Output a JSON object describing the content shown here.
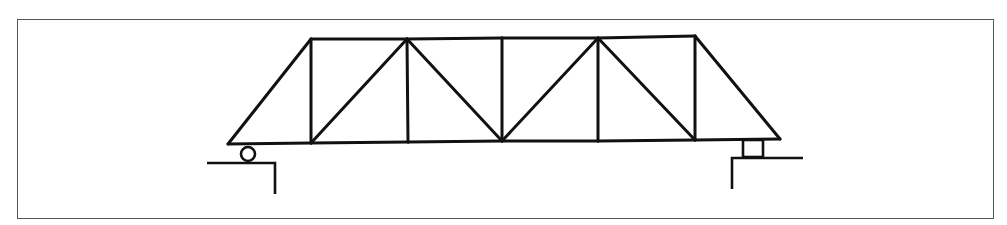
{
  "figure": {
    "frame": {
      "x": 17,
      "y": 19,
      "width": 977,
      "height": 200,
      "color": "#555555"
    },
    "stroke_color": "#111111"
  },
  "truss": {
    "type": "truss",
    "nodes": {
      "B0": [
        228,
        144
      ],
      "B1": [
        311,
        143
      ],
      "B2": [
        408,
        142
      ],
      "B3": [
        502,
        141
      ],
      "B4": [
        598,
        141
      ],
      "B5": [
        695,
        140
      ],
      "B6": [
        780,
        139
      ],
      "T1": [
        311,
        39
      ],
      "T2": [
        407,
        39
      ],
      "T3": [
        502,
        38
      ],
      "T4": [
        598,
        38
      ],
      "T5": [
        695,
        36
      ]
    },
    "members": [
      [
        "B0",
        "B1"
      ],
      [
        "B1",
        "B2"
      ],
      [
        "B2",
        "B3"
      ],
      [
        "B3",
        "B4"
      ],
      [
        "B4",
        "B5"
      ],
      [
        "B5",
        "B6"
      ],
      [
        "T1",
        "T2"
      ],
      [
        "T2",
        "T3"
      ],
      [
        "T3",
        "T4"
      ],
      [
        "T4",
        "T5"
      ],
      [
        "B0",
        "T1"
      ],
      [
        "T5",
        "B6"
      ],
      [
        "B1",
        "T1"
      ],
      [
        "B2",
        "T2"
      ],
      [
        "B3",
        "T3"
      ],
      [
        "B4",
        "T4"
      ],
      [
        "B5",
        "T5"
      ],
      [
        "B1",
        "T2"
      ],
      [
        "T2",
        "B3"
      ],
      [
        "B3",
        "T4"
      ],
      [
        "T4",
        "B5"
      ]
    ]
  },
  "supports": {
    "left": {
      "type": "roller",
      "circle": {
        "cx": 248,
        "cy": 154,
        "r": 7
      },
      "ground": [
        [
          207,
          163
        ],
        [
          275,
          163
        ],
        [
          275,
          194
        ]
      ]
    },
    "right": {
      "type": "pin-block",
      "block": {
        "x": 743,
        "y": 140,
        "width": 20,
        "height": 17
      },
      "ground": [
        [
          803,
          158
        ],
        [
          732,
          158
        ],
        [
          732,
          189
        ]
      ]
    }
  }
}
